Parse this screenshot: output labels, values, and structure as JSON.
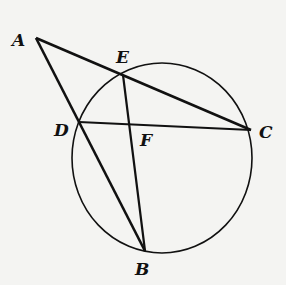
{
  "diagram": {
    "type": "geometry",
    "circle": {
      "cx": 162,
      "cy": 158,
      "rx": 90,
      "ry": 95
    },
    "points": {
      "A": {
        "label": "A",
        "x": 36,
        "y": 38,
        "lx": 12,
        "ly": 46
      },
      "E": {
        "label": "E",
        "x": 123,
        "y": 75,
        "lx": 116,
        "ly": 63
      },
      "D": {
        "label": "D",
        "x": 79,
        "y": 122,
        "lx": 54,
        "ly": 136
      },
      "F": {
        "label": "F",
        "x": 130,
        "y": 124,
        "lx": 140,
        "ly": 146
      },
      "C": {
        "label": "C",
        "x": 251,
        "y": 130,
        "lx": 259,
        "ly": 138
      },
      "B": {
        "label": "B",
        "x": 145,
        "y": 251,
        "lx": 135,
        "ly": 275
      }
    },
    "segments": [
      {
        "from": "A",
        "to": "C"
      },
      {
        "from": "A",
        "to": "B"
      },
      {
        "from": "D",
        "to": "C"
      },
      {
        "from": "E",
        "to": "B"
      }
    ],
    "colors": {
      "stroke": "#111111",
      "background": "#f4f4f2"
    }
  }
}
